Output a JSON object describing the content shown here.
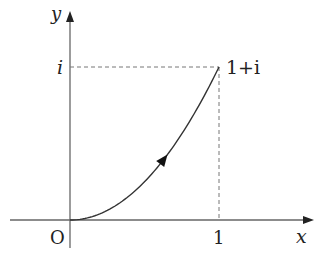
{
  "diagram": {
    "axes": {
      "x_label": "x",
      "y_label": "y",
      "origin_label": "O"
    },
    "ticks": {
      "x_tick_label": "1",
      "y_tick_label": "i"
    },
    "point": {
      "label": "1+i",
      "x": 1,
      "y": 1
    },
    "curve": {
      "description": "path from 0 to 1+i, y = x^2",
      "start": [
        0,
        0
      ],
      "end": [
        1,
        1
      ],
      "direction_arrow": "toward 1+i"
    },
    "colors": {
      "axis": "#555555",
      "curve": "#222222",
      "dashed": "#666666",
      "text": "#222222"
    }
  }
}
